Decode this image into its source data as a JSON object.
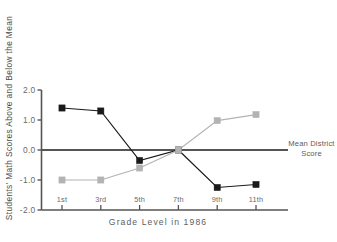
{
  "chart_data": {
    "type": "line",
    "title": "",
    "subtitle": "",
    "xlabel": "Grade Level in 1986",
    "ylabel": "Students' Math Scores Above and Below the Mean",
    "categories": [
      "1st",
      "3rd",
      "5th",
      "7th",
      "9th",
      "11th"
    ],
    "xtick_labels": [
      "1st",
      "3rd",
      "5th",
      "7th",
      "9th",
      "11th"
    ],
    "ytick_labels": [
      "2.0",
      "1.0",
      "0.0",
      "-1.0",
      "-2.0"
    ],
    "ytick_values": [
      2.0,
      1.0,
      0.0,
      -1.0,
      -2.0
    ],
    "ylim": [
      -2.0,
      2.0
    ],
    "xlim": [
      0,
      7
    ],
    "grid": false,
    "legend_position": "right-of-plot",
    "reference_line": {
      "value": 0.0,
      "label": "Mean District Score",
      "label_line_1": "Mean District",
      "label_line_2": "Score",
      "color": "#555555"
    },
    "series": [
      {
        "name": "dark-series",
        "color": "#1a1a1a",
        "marker": "square",
        "values": [
          1.4,
          1.3,
          -0.35,
          0.0,
          -1.25,
          -1.15
        ]
      },
      {
        "name": "light-series",
        "color": "#b3b3b3",
        "marker": "square",
        "values": [
          -1.0,
          -1.0,
          -0.6,
          0.0,
          0.98,
          1.18
        ]
      }
    ]
  },
  "colors": {
    "axis": "#555555",
    "dark_series": "#1a1a1a",
    "light_series": "#b3b3b3",
    "reference_line": "#555555",
    "background": "#ffffff",
    "tick_text": "#6a6a6a"
  }
}
